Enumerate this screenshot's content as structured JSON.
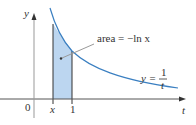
{
  "figure": {
    "y_axis_label": "y",
    "x_axis_label": "t",
    "origin_label": "0",
    "tick_labels": [
      "x",
      "1"
    ],
    "area_annotation": {
      "prefix": "area = ",
      "expression": "−ln x"
    },
    "curve_label": {
      "lhs": "y = ",
      "numerator": "1",
      "denominator": "t"
    },
    "colors": {
      "curve": "#3a7fc1",
      "shade": "#bcd6f0",
      "axis": "#555555"
    }
  }
}
